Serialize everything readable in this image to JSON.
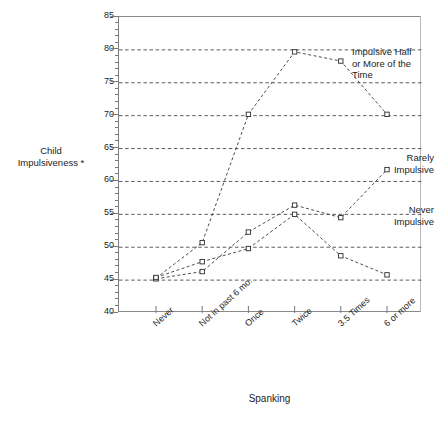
{
  "chart_data": {
    "type": "line",
    "title": "",
    "xlabel": "Spanking",
    "ylabel": "Child Impulsiveness *",
    "categories": [
      "Never",
      "Not in past 6 mo.",
      "Once",
      "Twice",
      "3.5 Times",
      "6 or more"
    ],
    "ylim": [
      40,
      85
    ],
    "y_ticks": [
      40,
      45,
      50,
      55,
      60,
      65,
      70,
      75,
      80,
      85
    ],
    "y_tick_labels": [
      "40",
      "45",
      "50",
      "55",
      "60",
      "65",
      "70",
      "75",
      "80",
      "85"
    ],
    "y_minor_tick_step": 1,
    "grid": "horizontal-dotted-at-major-ticks",
    "legend_position": "inline-right-annotations",
    "marker": "open-square",
    "linestyle": "dashed",
    "series": [
      {
        "name": "Impulsive Half or More of the Time",
        "values": [
          45.3,
          50.7,
          70.2,
          79.7,
          78.3,
          70.2
        ]
      },
      {
        "name": "Rarely Impulsive",
        "values": [
          45.2,
          46.3,
          52.3,
          56.4,
          54.5,
          61.8
        ]
      },
      {
        "name": "Never Impulsive",
        "values": [
          45.4,
          47.8,
          49.8,
          55.0,
          48.7,
          45.8
        ]
      }
    ],
    "annotations": [
      {
        "text": "Impulsive Half\nor More of the\nTime",
        "series": "Impulsive Half or More of the Time"
      },
      {
        "text": "Rarely\nImpulsive",
        "series": "Rarely Impulsive"
      },
      {
        "text": "Never\nImpulsive",
        "series": "Never Impulsive"
      }
    ]
  },
  "axes": {
    "y_title": "Child\nImpulsiveness *",
    "x_title": "Spanking"
  },
  "caption": ""
}
